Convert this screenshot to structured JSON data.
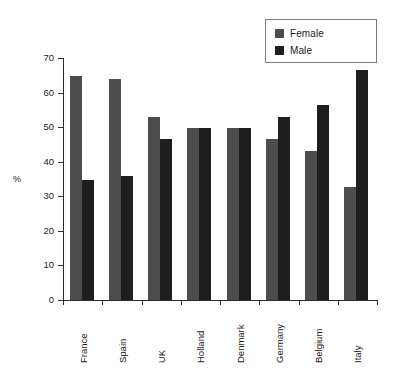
{
  "chart_data": {
    "type": "bar",
    "title": "",
    "xlabel": "",
    "ylabel": "%",
    "ylim": [
      0,
      70
    ],
    "yticks": [
      0,
      10,
      20,
      30,
      40,
      50,
      60,
      70
    ],
    "grid": false,
    "legend_position": "top-right",
    "categories": [
      "France",
      "Spain",
      "UK",
      "Holland",
      "Denmark",
      "Germany",
      "Belgium",
      "Italy"
    ],
    "series": [
      {
        "name": "Female",
        "color": "#4d4d4d",
        "values": [
          64.7,
          64.0,
          53.0,
          49.8,
          49.8,
          46.5,
          43.0,
          32.8
        ]
      },
      {
        "name": "Male",
        "color": "#1e1e1e",
        "values": [
          34.8,
          35.8,
          46.6,
          49.8,
          49.8,
          52.8,
          56.5,
          66.5
        ]
      }
    ]
  },
  "legend": {
    "items": [
      {
        "label": "Female",
        "color": "#4d4d4d"
      },
      {
        "label": "Male",
        "color": "#1e1e1e"
      }
    ]
  },
  "axes": {
    "y_title": "%",
    "y_tick_labels": [
      "0",
      "10",
      "20",
      "30",
      "40",
      "50",
      "60",
      "70"
    ],
    "x_tick_labels": [
      "France",
      "Spain",
      "UK",
      "Holland",
      "Denmark",
      "Germany",
      "Belgium",
      "Italy"
    ]
  }
}
